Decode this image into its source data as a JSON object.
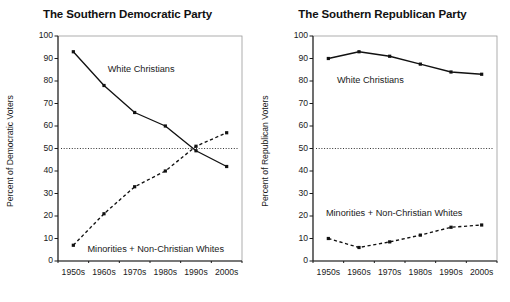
{
  "figure": {
    "background": "#ffffff",
    "ink": "#1a1a1a"
  },
  "chart_data": [
    {
      "type": "line",
      "title": "The Southern Democratic Party",
      "xlabel": "",
      "ylabel": "Percent of Democratic Voters",
      "categories": [
        "1950s",
        "1960s",
        "1970s",
        "1980s",
        "1990s",
        "2000s"
      ],
      "ylim": [
        0,
        100
      ],
      "yticks": [
        0,
        10,
        20,
        30,
        40,
        50,
        60,
        70,
        80,
        90,
        100
      ],
      "grid": false,
      "legend": "inline-annotations",
      "reference_line": {
        "value": 50,
        "style": "dotted",
        "color": "#333333"
      },
      "series": [
        {
          "name": "White Christians",
          "style": "solid",
          "marker": "square",
          "color": "#111111",
          "values": [
            93,
            78,
            66,
            60,
            49,
            42
          ]
        },
        {
          "name": "Minorities + Non-Christian Whites",
          "style": "dashed",
          "marker": "square",
          "color": "#111111",
          "values": [
            7,
            21,
            33,
            40,
            51,
            57
          ]
        }
      ],
      "annotations": [
        {
          "text": "White Christians",
          "x_frac": 0.27,
          "y_value": 85
        },
        {
          "text": "Minorities + Non-Christian Whites",
          "x_frac": 0.16,
          "y_value": 5
        }
      ]
    },
    {
      "type": "line",
      "title": "The Southern Republican Party",
      "xlabel": "",
      "ylabel": "Percent of Republican Voters",
      "categories": [
        "1950s",
        "1960s",
        "1970s",
        "1980s",
        "1990s",
        "2000s"
      ],
      "ylim": [
        0,
        100
      ],
      "yticks": [
        0,
        10,
        20,
        30,
        40,
        50,
        60,
        70,
        80,
        90,
        100
      ],
      "grid": false,
      "legend": "inline-annotations",
      "reference_line": {
        "value": 50,
        "style": "dotted",
        "color": "#333333"
      },
      "series": [
        {
          "name": "White Christians",
          "style": "solid",
          "marker": "square",
          "color": "#111111",
          "values": [
            90,
            93,
            91,
            87.5,
            84,
            83
          ]
        },
        {
          "name": "Minorities + Non-Christian Whites",
          "style": "dashed",
          "marker": "square",
          "color": "#111111",
          "values": [
            10,
            6,
            8.5,
            11.5,
            15,
            16
          ]
        }
      ],
      "annotations": [
        {
          "text": "White Christians",
          "x_frac": 0.13,
          "y_value": 80
        },
        {
          "text": "Minorities + Non-Christian Whites",
          "x_frac": 0.07,
          "y_value": 21
        }
      ]
    }
  ]
}
